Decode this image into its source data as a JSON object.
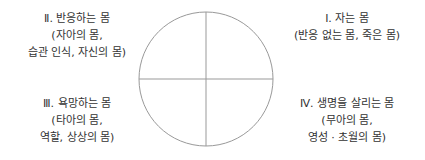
{
  "diagram": {
    "type": "quadrant-circle",
    "circle": {
      "cx": 206,
      "cy": 79,
      "r": 67,
      "stroke": "#999999"
    },
    "quadrants": {
      "top_left": {
        "title": "Ⅱ. 반응하는 몸",
        "line2": "(자아의 몸,",
        "line3": "습관 인식, 자신의 몸)"
      },
      "top_right": {
        "title": "Ⅰ. 자는 몸",
        "line2": "(반응 없는 몸, 죽은 몸)"
      },
      "bottom_left": {
        "title": "Ⅲ. 욕망하는 몸",
        "line2": "(타아의 몸,",
        "line3": "역할, 상상의 몸)"
      },
      "bottom_right": {
        "title": "Ⅳ. 생명을 살리는 몸",
        "line2": "(무아의 몸,",
        "line3": "영성 · 초월의 몸)"
      }
    }
  }
}
